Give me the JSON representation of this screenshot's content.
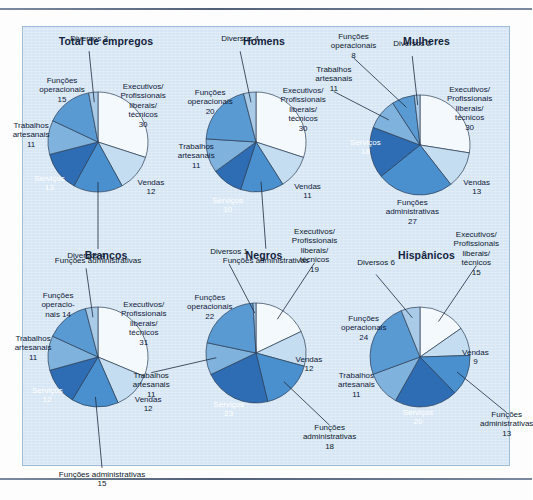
{
  "figure": {
    "panel_bg": "#d6e6f4",
    "rules": [
      "top-rule",
      "bottom-rule"
    ]
  },
  "palette": {
    "executivos": "#f4f9fd",
    "vendas": "#c5ddf0",
    "administrativas": "#4a90ce",
    "servicos": "#2e6db4",
    "artesanais": "#7fb2dd",
    "operacionais": "#5a9ad3",
    "diversos": "#a9cbe8",
    "stroke": "#2b3d55"
  },
  "chart_data": [
    {
      "type": "pie",
      "title": "Total de empregos",
      "categories": [
        "Executivos/\nProfissionais\nliberais/\ntécnicos",
        "Vendas",
        "Funções administrativas",
        "Serviços",
        "Trabalhos\nartesanais",
        "Funções\noperacionais",
        "Diversos"
      ],
      "values": [
        30,
        12,
        16,
        13,
        11,
        15,
        3
      ],
      "labels": [
        {
          "text": "Executivos/\nProfissionais\nliberais/\ntécnicos\n30",
          "placement": "inside"
        },
        {
          "text": "Vendas\n12",
          "placement": "inside"
        },
        {
          "text": "Funções administrativas",
          "placement": "outside"
        },
        {
          "text": "Serviços\n13",
          "placement": "inside-dark"
        },
        {
          "text": "Trabalhos\nartesanais\n11",
          "placement": "inside"
        },
        {
          "text": "Funções\noperacionais\n15",
          "placement": "inside"
        },
        {
          "text": "Diversos 3",
          "placement": "outside"
        }
      ]
    },
    {
      "type": "pie",
      "title": "Homens",
      "categories": [
        "Executivos/\nProfissionais\nliberais/\ntécnicos",
        "Vendas",
        "Funções administrativas",
        "Serviços",
        "Trabalhos\nartesanais",
        "Funções\noperacionais",
        "Diversos"
      ],
      "values": [
        30,
        11,
        14,
        10,
        11,
        20,
        4
      ],
      "labels": [
        {
          "text": "Executivos/\nProfissionais\nliberais/\ntécnicos\n30",
          "placement": "inside"
        },
        {
          "text": "Vendas\n11",
          "placement": "inside"
        },
        {
          "text": "Funções administrativas",
          "placement": "outside"
        },
        {
          "text": "Serviços\n10",
          "placement": "inside-dark"
        },
        {
          "text": "Trabalhos\nartesanais\n11",
          "placement": "inside"
        },
        {
          "text": "Funções\noperacionais\n20",
          "placement": "inside"
        },
        {
          "text": "Diversos 4",
          "placement": "outside"
        }
      ]
    },
    {
      "type": "pie",
      "title": "Mulheres",
      "categories": [
        "Executivos/\nProfissionais\nliberais/\ntécnicos",
        "Vendas",
        "Funções administrativas",
        "Serviços",
        "Trabalhos\nartesanais",
        "Funções\noperacionais",
        "Diversos"
      ],
      "values": [
        30,
        13,
        27,
        18,
        11,
        8,
        2
      ],
      "labels": [
        {
          "text": "Executivos/\nProfissionais\nliberais/\ntécnicos\n30",
          "placement": "inside"
        },
        {
          "text": "Vendas\n13",
          "placement": "inside"
        },
        {
          "text": "Funções\nadministrativas\n27",
          "placement": "inside"
        },
        {
          "text": "Serviços\n18",
          "placement": "inside-dark"
        },
        {
          "text": "Trabalhos\nartesanais\n11",
          "placement": "outside"
        },
        {
          "text": "Funções\noperacionais\n8",
          "placement": "outside"
        },
        {
          "text": "Diversos 2",
          "placement": "outside"
        }
      ]
    },
    {
      "type": "pie",
      "title": "Brancos",
      "categories": [
        "Executivos/\nProfissionais\nliberais/\ntécnicos",
        "Vendas",
        "Funções administrativas",
        "Serviços",
        "Trabalhos\nartesanais",
        "Funções\noperacionais",
        "Diversos"
      ],
      "values": [
        31,
        12,
        15,
        12,
        11,
        14,
        4
      ],
      "labels": [
        {
          "text": "Executivos/\nProfissionais\nliberais/\ntécnicos\n31",
          "placement": "inside"
        },
        {
          "text": "Vendas\n12",
          "placement": "inside"
        },
        {
          "text": "Funções administrativas\n15",
          "placement": "outside"
        },
        {
          "text": "Serviços\n12",
          "placement": "inside-dark"
        },
        {
          "text": "Trabalhos\nartesanais\n11",
          "placement": "inside"
        },
        {
          "text": "Funções\noperacio-\nnais 14",
          "placement": "inside"
        },
        {
          "text": "Diversos 4",
          "placement": "outside"
        }
      ]
    },
    {
      "type": "pie",
      "title": "Negros",
      "categories": [
        "Executivos/\nProfissionais\nliberais/\ntécnicos",
        "Vendas",
        "Funções administrativas",
        "Serviços",
        "Trabalhos\nartesanais",
        "Funções\noperacionais",
        "Diversos"
      ],
      "values": [
        19,
        12,
        18,
        23,
        11,
        22,
        1
      ],
      "labels": [
        {
          "text": "Executivos/\nProfissionais\nliberais/\ntécnicos\n19",
          "placement": "outside"
        },
        {
          "text": "Vendas\n12",
          "placement": "inside"
        },
        {
          "text": "Funções\nadministrativas\n18",
          "placement": "outside"
        },
        {
          "text": "Serviços\n23",
          "placement": "inside-dark"
        },
        {
          "text": "Trabalhos\nartesanais\n11",
          "placement": "outside"
        },
        {
          "text": "Funções\noperacionais\n22",
          "placement": "inside"
        },
        {
          "text": "Diversos 1",
          "placement": "outside"
        }
      ]
    },
    {
      "type": "pie",
      "title": "Hispânicos",
      "categories": [
        "Executivos/\nProfissionais\nliberais/\ntécnicos",
        "Vendas",
        "Funções administrativas",
        "Serviços",
        "Trabalhos\nartesanais",
        "Funções\noperacionais",
        "Diversos"
      ],
      "values": [
        15,
        9,
        13,
        20,
        11,
        24,
        6
      ],
      "labels": [
        {
          "text": "Executivos/\nProfissionais\nliberais/\ntécnicos\n15",
          "placement": "outside"
        },
        {
          "text": "Vendas\n9",
          "placement": "inside"
        },
        {
          "text": "Funções\nadministrativas\n13",
          "placement": "outside"
        },
        {
          "text": "Serviços\n20",
          "placement": "inside-dark"
        },
        {
          "text": "Trabalhos\nartesanais\n11",
          "placement": "inside"
        },
        {
          "text": "Funções\noperacionais\n24",
          "placement": "inside"
        },
        {
          "text": "Diversos 6",
          "placement": "outside"
        }
      ]
    }
  ]
}
